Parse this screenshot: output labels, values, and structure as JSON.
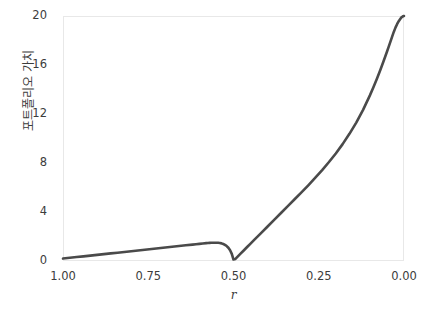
{
  "chart_data": {
    "type": "line",
    "title": "",
    "subtitle": "",
    "xlabel": "r",
    "ylabel": "포트폴리오 가치",
    "xlim": [
      1.0,
      0.0
    ],
    "ylim": [
      0,
      20
    ],
    "x_ticks": [
      "1.00",
      "0.75",
      "0.50",
      "0.25",
      "0.00"
    ],
    "x_tick_values": [
      1.0,
      0.75,
      0.5,
      0.25,
      0.0
    ],
    "y_ticks": [
      "0",
      "4",
      "8",
      "12",
      "16",
      "20"
    ],
    "y_tick_values": [
      0,
      4,
      8,
      12,
      16,
      20
    ],
    "x_axis_reversed": true,
    "grid": false,
    "legend": false,
    "legend_position": "none",
    "series": [
      {
        "name": "포트폴리오 가치",
        "color": "#4a4a4a",
        "line_width": 2.6,
        "x": [
          1.0,
          0.98,
          0.96,
          0.94,
          0.92,
          0.9,
          0.88,
          0.86,
          0.84,
          0.82,
          0.8,
          0.78,
          0.76,
          0.74,
          0.72,
          0.7,
          0.68,
          0.66,
          0.64,
          0.62,
          0.61,
          0.6,
          0.59,
          0.58,
          0.575,
          0.57,
          0.565,
          0.56,
          0.555,
          0.55,
          0.545,
          0.54,
          0.535,
          0.53,
          0.525,
          0.52,
          0.515,
          0.51,
          0.505,
          0.5,
          0.495,
          0.49,
          0.48,
          0.47,
          0.46,
          0.45,
          0.44,
          0.42,
          0.4,
          0.38,
          0.36,
          0.34,
          0.32,
          0.3,
          0.28,
          0.26,
          0.24,
          0.22,
          0.2,
          0.18,
          0.16,
          0.14,
          0.12,
          0.1,
          0.09,
          0.08,
          0.07,
          0.06,
          0.05,
          0.045,
          0.04,
          0.035,
          0.03,
          0.025,
          0.02,
          0.015,
          0.012,
          0.01,
          0.008,
          0.006,
          0.004,
          0.002,
          0.0
        ],
        "y": [
          0.2,
          0.26,
          0.32,
          0.38,
          0.44,
          0.5,
          0.56,
          0.62,
          0.68,
          0.74,
          0.8,
          0.86,
          0.92,
          0.98,
          1.04,
          1.1,
          1.16,
          1.22,
          1.28,
          1.34,
          1.37,
          1.4,
          1.43,
          1.46,
          1.47,
          1.48,
          1.485,
          1.49,
          1.49,
          1.49,
          1.485,
          1.47,
          1.44,
          1.39,
          1.32,
          1.22,
          1.08,
          0.88,
          0.58,
          0.12,
          0.16,
          0.3,
          0.58,
          0.86,
          1.14,
          1.42,
          1.7,
          2.26,
          2.82,
          3.38,
          3.94,
          4.5,
          5.06,
          5.62,
          6.2,
          6.8,
          7.42,
          8.08,
          8.78,
          9.54,
          10.38,
          11.3,
          12.34,
          13.52,
          14.16,
          14.84,
          15.55,
          16.3,
          17.08,
          17.48,
          17.89,
          18.3,
          18.7,
          19.05,
          19.35,
          19.6,
          19.72,
          19.8,
          19.87,
          19.92,
          19.96,
          19.99,
          20.0
        ]
      }
    ],
    "annotations": [],
    "background_color": "#ffffff",
    "spine_color": "#e8e8e8",
    "tick_label_color": "#3c3c3c",
    "axis_label_color": "#3c3c3c"
  }
}
